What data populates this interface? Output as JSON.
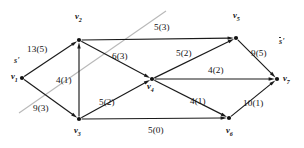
{
  "figure": {
    "type": "flow-network-diagram",
    "background_color": "#ffffff",
    "edge_color": "#1a1a1a",
    "cut_line_color": "#b8b8b8"
  },
  "nodes": [
    {
      "id": "v1",
      "label": "v",
      "sub": "1",
      "x": 22,
      "y": 78
    },
    {
      "id": "v2",
      "label": "v",
      "sub": "2",
      "x": 79,
      "y": 40
    },
    {
      "id": "v3",
      "label": "v",
      "sub": "3",
      "x": 79,
      "y": 119
    },
    {
      "id": "v4",
      "label": "v",
      "sub": "4",
      "x": 152,
      "y": 79
    },
    {
      "id": "v5",
      "label": "v",
      "sub": "5",
      "x": 236,
      "y": 38
    },
    {
      "id": "v6",
      "label": "v",
      "sub": "6",
      "x": 229,
      "y": 118
    },
    {
      "id": "v7",
      "label": "v",
      "sub": "7",
      "x": 277,
      "y": 79
    }
  ],
  "node_labels": [
    {
      "node": "v1",
      "text": "v",
      "sub": "1",
      "x": 11,
      "y": 72
    },
    {
      "node": "v2",
      "text": "v",
      "sub": "2",
      "x": 75,
      "y": 12
    },
    {
      "node": "v3",
      "text": "v",
      "sub": "3",
      "x": 74,
      "y": 126
    },
    {
      "node": "v4",
      "text": "v",
      "sub": "4",
      "x": 147,
      "y": 82
    },
    {
      "node": "v5",
      "text": "v",
      "sub": "5",
      "x": 233,
      "y": 11
    },
    {
      "node": "v6",
      "text": "v",
      "sub": "6",
      "x": 226,
      "y": 126
    },
    {
      "node": "v7",
      "text": "v",
      "sub": "7",
      "x": 283,
      "y": 74
    }
  ],
  "edges": [
    {
      "id": "e-v1-v2",
      "from": "v1",
      "to": "v2",
      "capacity": 13,
      "flow": 5,
      "label": "13(5)",
      "label_x": 27,
      "label_y": 45
    },
    {
      "id": "e-v1-v3",
      "from": "v1",
      "to": "v3",
      "capacity": 9,
      "flow": 3,
      "label": "9(3)",
      "label_x": 33,
      "label_y": 104
    },
    {
      "id": "e-v3-v2",
      "from": "v3",
      "to": "v2",
      "capacity": 4,
      "flow": 1,
      "label": "4(1)",
      "label_x": 56,
      "label_y": 76
    },
    {
      "id": "e-v2-v5",
      "from": "v2",
      "to": "v5",
      "capacity": 5,
      "flow": 3,
      "label": "5(3)",
      "label_x": 154,
      "label_y": 23
    },
    {
      "id": "e-v2-v4",
      "from": "v2",
      "to": "v4",
      "capacity": 6,
      "flow": 3,
      "label": "6(3)",
      "label_x": 112,
      "label_y": 52
    },
    {
      "id": "e-v3-v4",
      "from": "v3",
      "to": "v4",
      "capacity": 5,
      "flow": 2,
      "label": "5(2)",
      "label_x": 99,
      "label_y": 98
    },
    {
      "id": "e-v3-v6",
      "from": "v3",
      "to": "v6",
      "capacity": 5,
      "flow": 0,
      "label": "5(0)",
      "label_x": 148,
      "label_y": 126
    },
    {
      "id": "e-v4-v5",
      "from": "v4",
      "to": "v5",
      "capacity": 5,
      "flow": 2,
      "label": "5(2)",
      "label_x": 176,
      "label_y": 49
    },
    {
      "id": "e-v4-v7",
      "from": "v4",
      "to": "v7",
      "capacity": 4,
      "flow": 2,
      "label": "4(2)",
      "label_x": 208,
      "label_y": 66
    },
    {
      "id": "e-v4-v6",
      "from": "v4",
      "to": "v6",
      "capacity": 4,
      "flow": 1,
      "label": "4(1)",
      "label_x": 190,
      "label_y": 97
    },
    {
      "id": "e-v5-v7",
      "from": "v5",
      "to": "v7",
      "capacity": 9,
      "flow": 5,
      "label": "9(5)",
      "label_x": 251,
      "label_y": 49
    },
    {
      "id": "e-v6-v7",
      "from": "v6",
      "to": "v7",
      "capacity": 10,
      "flow": 1,
      "label": "10(1)",
      "label_x": 243,
      "label_y": 99
    }
  ],
  "cut": {
    "line": {
      "x1": 19,
      "y1": 113,
      "x2": 166,
      "y2": 11
    },
    "source_side_label": {
      "text": "s",
      "prime": "'",
      "x": 14,
      "y": 57
    },
    "sink_side_label": {
      "text": "s",
      "prime": "'",
      "x": 279,
      "y": 38
    }
  }
}
